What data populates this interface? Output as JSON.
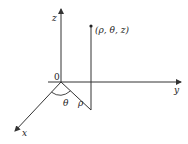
{
  "diagram": {
    "type": "cylindrical-coordinates",
    "axes": {
      "z": {
        "label": "z"
      },
      "y": {
        "label": "y"
      },
      "x": {
        "label": "x"
      }
    },
    "origin_label": "0",
    "point_label": "(ρ, θ, z)",
    "angle_label": "θ",
    "radius_label": "ρ",
    "colors": {
      "stroke": "#333333",
      "background": "#ffffff"
    }
  }
}
